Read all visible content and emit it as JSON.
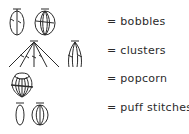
{
  "legend": {
    "rows": [
      {
        "symbols": [
          "bobble-small-icon",
          "bobble-large-icon"
        ],
        "label": "= bobbles"
      },
      {
        "symbols": [
          "cluster-fan-icon",
          "cluster-narrow-icon"
        ],
        "label": "= clusters"
      },
      {
        "symbols": [
          "popcorn-icon"
        ],
        "label": "= popcorn"
      },
      {
        "symbols": [
          "puff-small-icon",
          "puff-large-icon"
        ],
        "label": "= puff stitches"
      }
    ]
  },
  "colors": {
    "ink": "#2a2a2a",
    "background": "#ffffff"
  }
}
